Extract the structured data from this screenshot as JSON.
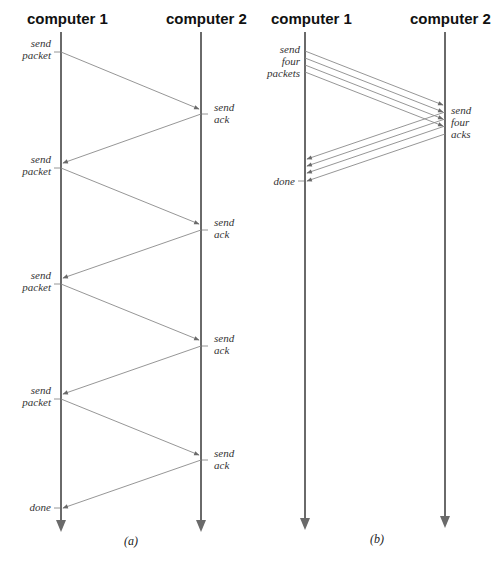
{
  "panels": [
    {
      "id": "a",
      "caption": "(a)",
      "left_header": "computer 1",
      "right_header": "computer 2",
      "left_labels": [
        {
          "lines": [
            "send",
            "packet"
          ]
        },
        {
          "lines": [
            "send",
            "packet"
          ]
        },
        {
          "lines": [
            "send",
            "packet"
          ]
        },
        {
          "lines": [
            "send",
            "packet"
          ]
        },
        {
          "lines": [
            "done"
          ]
        }
      ],
      "right_labels": [
        {
          "lines": [
            "send",
            "ack"
          ]
        },
        {
          "lines": [
            "send",
            "ack"
          ]
        },
        {
          "lines": [
            "send",
            "ack"
          ]
        },
        {
          "lines": [
            "send",
            "ack"
          ]
        }
      ]
    },
    {
      "id": "b",
      "caption": "(b)",
      "left_header": "computer 1",
      "right_header": "computer 2",
      "left_labels": [
        {
          "lines": [
            "send",
            "four",
            "packets"
          ]
        },
        {
          "lines": [
            "done"
          ]
        }
      ],
      "right_labels": [
        {
          "lines": [
            "send",
            "four",
            "acks"
          ]
        }
      ]
    }
  ],
  "colors": {
    "timeline": "#6a6a6a",
    "message": "#8a8a8a",
    "text": "#111111"
  }
}
